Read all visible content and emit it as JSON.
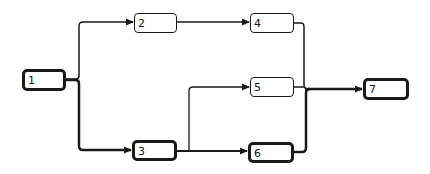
{
  "diagram": {
    "type": "network-flow",
    "nodes": [
      {
        "id": "1",
        "label": "1",
        "x": 22,
        "y": 69,
        "w": 44,
        "h": 22,
        "critical": true
      },
      {
        "id": "2",
        "label": "2",
        "x": 134,
        "y": 13,
        "w": 43,
        "h": 20,
        "critical": false
      },
      {
        "id": "3",
        "label": "3",
        "x": 132,
        "y": 140,
        "w": 45,
        "h": 21,
        "critical": true
      },
      {
        "id": "4",
        "label": "4",
        "x": 250,
        "y": 13,
        "w": 44,
        "h": 20,
        "critical": false
      },
      {
        "id": "5",
        "label": "5",
        "x": 250,
        "y": 77,
        "w": 44,
        "h": 20,
        "critical": false
      },
      {
        "id": "6",
        "label": "6",
        "x": 248,
        "y": 142,
        "w": 46,
        "h": 21,
        "critical": true
      },
      {
        "id": "7",
        "label": "7",
        "x": 363,
        "y": 78,
        "w": 46,
        "h": 22,
        "critical": true
      }
    ],
    "edges": [
      {
        "from": "1",
        "to": "2",
        "critical": false
      },
      {
        "from": "1",
        "to": "3",
        "critical": true
      },
      {
        "from": "2",
        "to": "4",
        "critical": false
      },
      {
        "from": "3",
        "to": "5",
        "critical": false
      },
      {
        "from": "3",
        "to": "6",
        "critical": true
      },
      {
        "from": "4",
        "to": "7",
        "critical": false
      },
      {
        "from": "5",
        "to": "7",
        "critical": false
      },
      {
        "from": "6",
        "to": "7",
        "critical": true
      }
    ],
    "colors": {
      "line": "#1a1a1a",
      "background": "#ffffff"
    }
  }
}
